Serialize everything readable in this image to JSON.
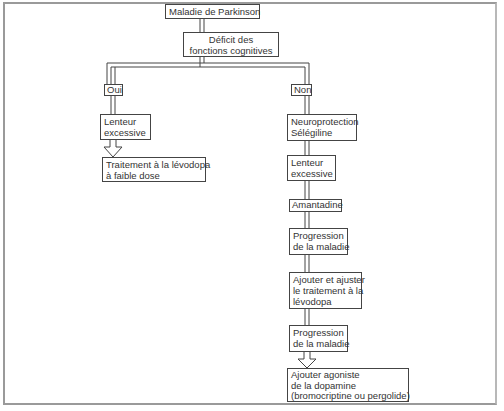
{
  "diagram": {
    "title": "Maladie de Parkinson",
    "decision": {
      "lines": [
        "Déficit des",
        "fonctions cognitives"
      ]
    },
    "branches": {
      "yes": {
        "label": "Oui",
        "steps": [
          {
            "lines": [
              "Lenteur",
              "excessive"
            ]
          },
          {
            "lines": [
              "Traitement à la lévodopa",
              "à faible dose"
            ]
          }
        ]
      },
      "no": {
        "label": "Non",
        "steps": [
          {
            "lines": [
              "Neuroprotection",
              "Sélégiline"
            ]
          },
          {
            "lines": [
              "Lenteur",
              "excessive"
            ]
          },
          {
            "lines": [
              "Amantadine"
            ]
          },
          {
            "lines": [
              "Progression",
              "de la maladie"
            ]
          },
          {
            "lines": [
              "Ajouter et ajuster",
              "le traitement à la",
              "lévodopa"
            ]
          },
          {
            "lines": [
              "Progression",
              "de la maladie"
            ]
          },
          {
            "lines": [
              "Ajouter agoniste",
              "de la dopamine",
              "(bromocriptine ou pergolide)"
            ]
          }
        ]
      }
    },
    "colors": {
      "line": "#444444",
      "frame": "#9a9a9a",
      "background": "#ffffff"
    }
  }
}
